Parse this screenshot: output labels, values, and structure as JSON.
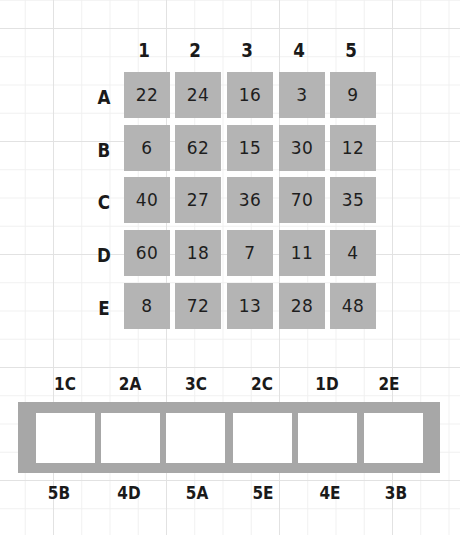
{
  "puzzle": {
    "columns": [
      "1",
      "2",
      "3",
      "4",
      "5"
    ],
    "rows": [
      "A",
      "B",
      "C",
      "D",
      "E"
    ],
    "grid": [
      [
        "22",
        "24",
        "16",
        "3",
        "9"
      ],
      [
        "6",
        "62",
        "15",
        "30",
        "12"
      ],
      [
        "40",
        "27",
        "36",
        "70",
        "35"
      ],
      [
        "60",
        "18",
        "7",
        "11",
        "4"
      ],
      [
        "8",
        "72",
        "13",
        "28",
        "48"
      ]
    ],
    "cell_color": "#b4b4b4"
  },
  "answer_strip": {
    "top_clues": [
      "1C",
      "2A",
      "3C",
      "2C",
      "1D",
      "2E"
    ],
    "bottom_clues": [
      "5B",
      "4D",
      "5A",
      "5E",
      "4E",
      "3B"
    ],
    "answers": [
      "",
      "",
      "",
      "",
      "",
      ""
    ],
    "strip_color": "#a7a7a7"
  }
}
